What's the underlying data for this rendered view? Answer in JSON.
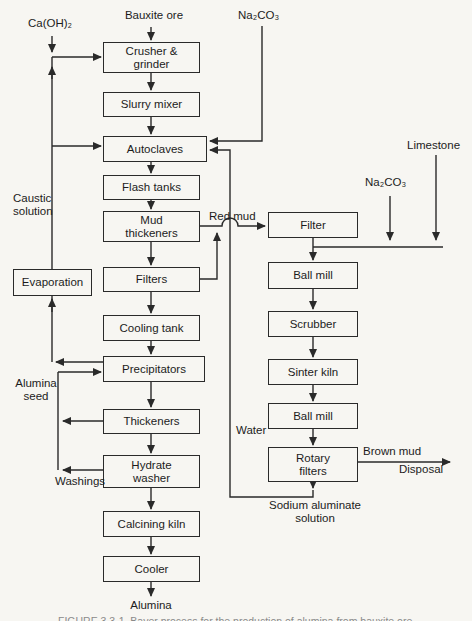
{
  "diagram": {
    "type": "process-flow",
    "colors": {
      "line": "#2a2a2a",
      "paper": "#f7f6f2"
    },
    "nodes": {
      "crusher": {
        "label": "Crusher &\ngrinder"
      },
      "slurry": {
        "label": "Slurry mixer"
      },
      "autoclaves": {
        "label": "Autoclaves"
      },
      "flash": {
        "label": "Flash tanks"
      },
      "mud_thickeners": {
        "label": "Mud\nthickeners"
      },
      "filters": {
        "label": "Filters"
      },
      "cooling": {
        "label": "Cooling tank"
      },
      "precipitators": {
        "label": "Precipitators"
      },
      "thickeners": {
        "label": "Thickeners"
      },
      "hydrate_washer": {
        "label": "Hydrate\nwasher"
      },
      "calcining": {
        "label": "Calcining kiln"
      },
      "cooler": {
        "label": "Cooler"
      },
      "evaporation": {
        "label": "Evaporation"
      },
      "filter2": {
        "label": "Filter"
      },
      "ball_mill_1": {
        "label": "Ball mill"
      },
      "scrubber": {
        "label": "Scrubber"
      },
      "sinter_kiln": {
        "label": "Sinter kiln"
      },
      "ball_mill_2": {
        "label": "Ball mill"
      },
      "rotary_filters": {
        "label": "Rotary\nfilters"
      }
    },
    "streams": {
      "ca_oh2": "Ca(OH)₂",
      "bauxite": "Bauxite ore",
      "na2co3_top": "Na₂CO₃",
      "limestone": "Limestone",
      "caustic": "Caustic\nsolution",
      "red_mud": "Red mud",
      "na2co3_right": "Na₂CO₃",
      "alumina_seed": "Alumina\nseed",
      "water": "Water",
      "washings": "Washings",
      "brown_mud": "Brown mud",
      "disposal": "Disposal",
      "sodium_aluminate": "Sodium aluminate\nsolution",
      "alumina": "Alumina"
    },
    "caption_cropped": "FIGURE 3.3-1. Bayer process for the production of alumina from bauxite ore."
  }
}
